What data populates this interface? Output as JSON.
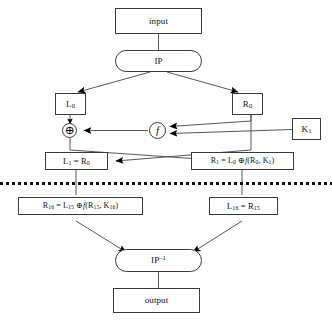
{
  "diagram": {
    "type": "flowchart",
    "colors": {
      "stroke": "#3a3a3a",
      "line": "#444444",
      "arrow_fill": "#000000",
      "text": "#111111",
      "background": "#ffffff",
      "separator": "#111111"
    },
    "nodes": {
      "input": {
        "label": "input",
        "shape": "rectangle"
      },
      "ip": {
        "label": "IP",
        "shape": "rounded"
      },
      "l0": {
        "label": "L0",
        "base": "L",
        "sub": "0",
        "shape": "rectangle"
      },
      "r0": {
        "label": "R0",
        "base": "R",
        "sub": "0",
        "shape": "rectangle"
      },
      "xor": {
        "label": "XOR",
        "glyph": "⊕",
        "shape": "circle"
      },
      "f": {
        "label": "f",
        "glyph": "f",
        "shape": "circle"
      },
      "k1": {
        "label": "K1",
        "base": "K",
        "sub": "1",
        "shape": "rectangle"
      },
      "l1": {
        "label": "L1 = R0",
        "lhs_base": "L",
        "lhs_sub": "1",
        "rhs_base": "R",
        "rhs_sub": "0",
        "shape": "rectangle"
      },
      "r1": {
        "label": "R1 = L0 ⊕ f(R0, K1)",
        "lhs_base": "R",
        "lhs_sub": "1",
        "t1_base": "L",
        "t1_sub": "0",
        "op": "⊕",
        "fn": "f",
        "a1_base": "R",
        "a1_sub": "0",
        "a2_base": "K",
        "a2_sub": "1",
        "shape": "rectangle"
      },
      "r16": {
        "label": "R16 = L15 ⊕ f(R15, K16)",
        "lhs_base": "R",
        "lhs_sub": "16",
        "t1_base": "L",
        "t1_sub": "15",
        "op": "⊕",
        "fn": "f",
        "a1_base": "R",
        "a1_sub": "15",
        "a2_base": "K",
        "a2_sub": "16",
        "shape": "rectangle"
      },
      "l16": {
        "label": "L16 = R15",
        "lhs_base": "L",
        "lhs_sub": "16",
        "rhs_base": "R",
        "rhs_sub": "15",
        "shape": "rectangle"
      },
      "ipinv": {
        "label": "IP-1",
        "base": "IP",
        "sup": "–1",
        "shape": "rounded"
      },
      "output": {
        "label": "output",
        "shape": "rectangle"
      }
    },
    "separator": {
      "style": "dotted",
      "meaning": "rounds 2 through 15 omitted"
    },
    "equals": "=",
    "comma": ","
  }
}
